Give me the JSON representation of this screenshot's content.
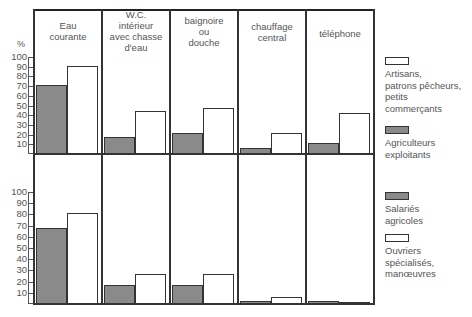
{
  "chart_data": {
    "type": "bar",
    "title": "",
    "ylabel": "%",
    "ylim": [
      0,
      100
    ],
    "y_ticks": [
      10,
      20,
      30,
      40,
      50,
      60,
      70,
      80,
      90,
      100
    ],
    "categories": [
      "Eau\ncourante",
      "W.C.\nintérieur\navec chasse\nd'eau",
      "baignoire\nou\ndouche",
      "chauffage\ncentral",
      "téléphone"
    ],
    "panels": [
      {
        "name": "top",
        "series": [
          {
            "name": "Agriculteurs exploitants",
            "fill": "gray",
            "values": [
              71,
              18,
              22,
              6,
              11
            ]
          },
          {
            "name": "Artisans, patrons pêcheurs, petits commerçants",
            "fill": "white",
            "values": [
              91,
              44,
              47,
              22,
              42
            ]
          }
        ]
      },
      {
        "name": "bottom",
        "series": [
          {
            "name": "Salariés agricoles",
            "fill": "gray",
            "values": [
              68,
              17,
              17,
              3,
              3
            ]
          },
          {
            "name": "Ouvriers spécialisés, manœuvres",
            "fill": "white",
            "values": [
              81,
              27,
              27,
              6,
              2
            ]
          }
        ]
      }
    ],
    "legend": [
      {
        "label": "Artisans,\npatrons pêcheurs,\npetits\ncommerçants",
        "fill": "white"
      },
      {
        "label": "Agriculteurs\nexploitants",
        "fill": "gray"
      },
      {
        "label": "Salariés\nagricoles",
        "fill": "gray"
      },
      {
        "label": "Ouvriers\nspécialisés,\nmanœuvres",
        "fill": "white"
      }
    ],
    "legend_position": "right",
    "grid": false,
    "colors": {
      "gray": "#8a8a8a",
      "white": "#ffffff",
      "stroke": "#333333"
    }
  },
  "labels": {
    "percent": "%",
    "col0": "Eau\ncourante",
    "col1": "W.C.\nintérieur\navec chasse\nd'eau",
    "col2": "baignoire\nou\ndouche",
    "col3": "chauffage\ncentral",
    "col4": "téléphone",
    "legend0": "Artisans,\npatrons pêcheurs,\npetits\ncommerçants",
    "legend1": "Agriculteurs\nexploitants",
    "legend2": "Salariés\nagricoles",
    "legend3": "Ouvriers\nspécialisés,\nmanœuvres"
  }
}
